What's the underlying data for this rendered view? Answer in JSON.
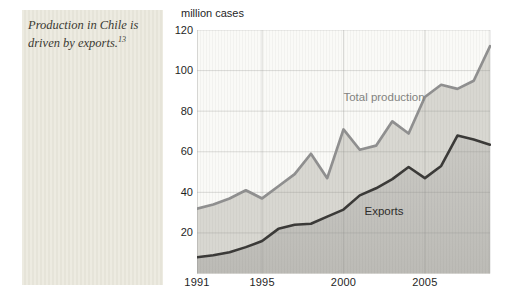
{
  "sidebar": {
    "note_text": "Production in Chile is driven by exports.",
    "footnote_ref": "13"
  },
  "chart": {
    "unit_label": "million cases",
    "series_label_total": "Total production",
    "series_label_exports": "Exports"
  },
  "chart_data": {
    "type": "area",
    "title": "",
    "xlabel": "",
    "ylabel": "million cases",
    "x": [
      1991,
      1992,
      1993,
      1994,
      1995,
      1996,
      1997,
      1998,
      1999,
      2000,
      2001,
      2002,
      2003,
      2004,
      2005,
      2006,
      2007,
      2008,
      2009
    ],
    "series": [
      {
        "name": "Total production",
        "values": [
          32,
          34,
          37,
          41,
          37,
          43,
          49,
          59,
          47,
          71,
          61,
          63,
          75,
          69,
          87,
          93,
          91,
          95,
          112
        ]
      },
      {
        "name": "Exports",
        "values": [
          8,
          9,
          10.5,
          13,
          16,
          22,
          24,
          24.5,
          28,
          31.5,
          38.5,
          42,
          46.5,
          52.5,
          47,
          53,
          68,
          66,
          63.5
        ]
      }
    ],
    "xlim": [
      1991,
      2009
    ],
    "ylim": [
      0,
      120
    ],
    "x_ticks": [
      "1991",
      "1995",
      "2000",
      "2005"
    ],
    "x_tick_years": [
      1991,
      1995,
      2000,
      2005
    ],
    "y_ticks": [
      20,
      40,
      60,
      80,
      100,
      120
    ],
    "grid": true,
    "legend_position": "inline-labels",
    "colors": {
      "total_line": "#8f8f8f",
      "exports_line": "#3b3a38",
      "total_fill": "#d8d7d1",
      "exports_fill_top": "#cac9c4",
      "exports_fill_bottom": "#bcbbb6",
      "grid": "#8f8f8b",
      "plot_background": "#fafaf7",
      "tick_text": "#1f1f1f"
    }
  }
}
